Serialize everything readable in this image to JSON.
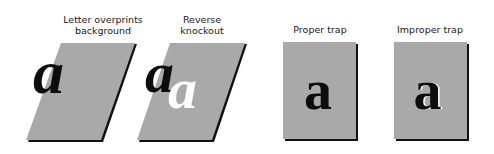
{
  "colors": {
    "background": "#ffffff",
    "panel_fill": "#a9a9a9",
    "panel_shadow": "#111111",
    "letter_dark": "#0d0d0d",
    "letter_knockout": "#ffffff",
    "caption_text": "#1a1a1a"
  },
  "panels": [
    {
      "id": "overprint",
      "caption_line1": "Letter overprints",
      "caption_line2": "background",
      "shape": "parallelogram",
      "letter": "a",
      "letter_style": "italic",
      "description": "black letter overprints slanted gray background"
    },
    {
      "id": "knockout",
      "caption_line1": "Reverse",
      "caption_line2": "knockout",
      "shape": "parallelogram",
      "letter": "a",
      "knockout_letter": "a",
      "letter_style": "italic",
      "description": "black letter plus white knocked-out letter on slanted gray background"
    },
    {
      "id": "proper-trap",
      "caption_line1": "Proper trap",
      "shape": "rectangle",
      "letter": "a",
      "letter_style": "upright"
    },
    {
      "id": "improper-trap",
      "caption_line1": "Improper trap",
      "shape": "rectangle",
      "letter": "a",
      "letter_style": "upright",
      "description": "letter with white gap (misregistration) along right edges"
    }
  ]
}
